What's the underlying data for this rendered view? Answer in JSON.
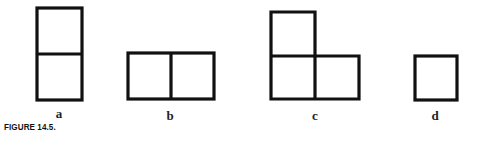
{
  "figure": {
    "caption": "FIGURE 14.5.",
    "stroke_color": "#111111",
    "background": "#ffffff",
    "shapes": [
      {
        "id": "a",
        "label": "a",
        "description": "two squares stacked vertically",
        "cells": 2
      },
      {
        "id": "b",
        "label": "b",
        "description": "two squares side by side horizontally",
        "cells": 2
      },
      {
        "id": "c",
        "label": "c",
        "description": "L-shaped arrangement of three squares",
        "cells": 3
      },
      {
        "id": "d",
        "label": "d",
        "description": "single square",
        "cells": 1
      }
    ]
  }
}
